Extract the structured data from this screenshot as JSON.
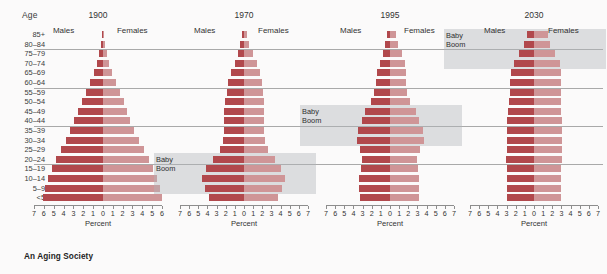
{
  "caption": "An Aging Society",
  "age_axis_title": "Age",
  "x_axis_title": "Percent",
  "male_label": "Males",
  "female_label": "Females",
  "babyboom_label_line1": "Baby",
  "babyboom_label_line2": "Boom",
  "colors": {
    "male_bar": "#b1484c",
    "female_bar": "#cf9597",
    "callout_box": "#b0b5ba",
    "gridline": "#9a9a9a",
    "background": "#fbfafa"
  },
  "chart_data": {
    "type": "bar",
    "subtype": "population-pyramid",
    "title": "An Aging Society",
    "xlabel": "Percent",
    "ylabel": "Age",
    "grid": true,
    "legend_position": "top-inline",
    "legend": [
      "Males",
      "Females"
    ],
    "xlim": [
      -7,
      7
    ],
    "xticks_1900": [
      7,
      6,
      5,
      4,
      3,
      2,
      1,
      0,
      1,
      2,
      3,
      4,
      5,
      6
    ],
    "xticks": [
      7,
      6,
      5,
      4,
      3,
      2,
      1,
      0,
      1,
      2,
      3,
      4,
      5,
      6,
      7
    ],
    "categories": [
      "85+",
      "80–84",
      "75–79",
      "70–74",
      "65–69",
      "60–64",
      "55–59",
      "50–54",
      "45–49",
      "40–44",
      "35–39",
      "30–34",
      "25–29",
      "20–24",
      "15–19",
      "10–14",
      "5–9",
      "<5"
    ],
    "gridline_after_categories": [
      "80–84",
      "60–64",
      "40–44",
      "20–24"
    ],
    "panels": [
      {
        "year": "1900",
        "males": [
          0.1,
          0.2,
          0.4,
          0.6,
          0.9,
          1.3,
          1.7,
          2.1,
          2.5,
          2.9,
          3.3,
          3.8,
          4.3,
          4.8,
          5.2,
          5.6,
          5.9,
          6.1
        ],
        "females": [
          0.1,
          0.2,
          0.4,
          0.6,
          0.9,
          1.3,
          1.7,
          2.1,
          2.4,
          2.8,
          3.2,
          3.7,
          4.2,
          4.7,
          5.1,
          5.5,
          5.8,
          6.0
        ],
        "babyboom": null
      },
      {
        "year": "1970",
        "males": [
          0.2,
          0.4,
          0.7,
          1.0,
          1.4,
          1.7,
          1.9,
          2.1,
          2.2,
          2.2,
          2.2,
          2.3,
          2.6,
          3.4,
          4.2,
          4.6,
          4.3,
          3.8
        ],
        "females": [
          0.3,
          0.6,
          1.0,
          1.4,
          1.8,
          2.0,
          2.1,
          2.2,
          2.2,
          2.2,
          2.2,
          2.3,
          2.6,
          3.4,
          4.1,
          4.5,
          4.2,
          3.7
        ],
        "babyboom": {
          "from": "20–24",
          "to": "5–9"
        }
      },
      {
        "year": "1995",
        "males": [
          0.3,
          0.5,
          0.8,
          1.1,
          1.4,
          1.5,
          1.7,
          2.1,
          2.7,
          3.1,
          3.5,
          3.6,
          3.3,
          3.1,
          3.2,
          3.4,
          3.4,
          3.3
        ],
        "females": [
          0.7,
          0.9,
          1.3,
          1.6,
          1.8,
          1.8,
          1.9,
          2.2,
          2.8,
          3.2,
          3.6,
          3.7,
          3.3,
          3.0,
          3.1,
          3.2,
          3.2,
          3.2
        ],
        "babyboom": {
          "from": "45–49",
          "to": "30–34"
        }
      },
      {
        "year": "2030",
        "males": [
          0.8,
          1.1,
          1.6,
          2.2,
          2.5,
          2.6,
          2.6,
          2.7,
          2.8,
          2.9,
          3.0,
          3.0,
          3.0,
          3.1,
          3.0,
          3.0,
          2.9,
          2.9
        ],
        "females": [
          1.5,
          1.8,
          2.3,
          2.8,
          3.0,
          3.0,
          2.9,
          3.0,
          3.0,
          3.1,
          3.1,
          3.1,
          3.1,
          3.1,
          3.0,
          3.0,
          2.9,
          2.9
        ],
        "babyboom": {
          "from": "85+",
          "to": "70–74"
        }
      }
    ]
  }
}
